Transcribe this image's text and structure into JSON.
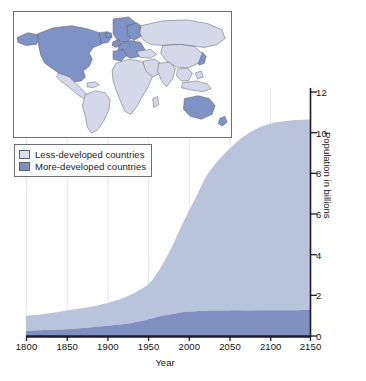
{
  "figure": {
    "kind": "area-chart-with-map-inset",
    "background": "#ffffff"
  },
  "colors": {
    "less_developed": "#b9c4dc",
    "more_developed": "#7f8fc0",
    "axis": "#1b1b2b",
    "gridline": "#e2e6ef",
    "map_land_less_developed": "#d4d8e8",
    "map_land_more_developed": "#7f92c6",
    "map_border": "#6d6d75",
    "map_ocean": "#ffffff"
  },
  "map_inset": {
    "name": "world-map-inset",
    "more_developed_regions": [
      "United States",
      "Canada",
      "Greenland",
      "Europe",
      "Russia",
      "Japan",
      "Australia",
      "New Zealand"
    ],
    "less_developed_regions": [
      "Latin America",
      "Africa",
      "Asia",
      "Middle East",
      "Oceania"
    ]
  },
  "legend": {
    "items": [
      {
        "label": "Less-developed countries",
        "color": "#d9dff0",
        "key": "less_developed"
      },
      {
        "label": "More-developed countries",
        "color": "#7f8fc0",
        "key": "more_developed"
      }
    ]
  },
  "chart_data": {
    "type": "area",
    "stacked": true,
    "title": "",
    "xlabel": "Year",
    "ylabel": "Population in billions",
    "xlim": [
      1800,
      2150
    ],
    "ylim": [
      0,
      12
    ],
    "xticks": [
      1800,
      1850,
      1900,
      1950,
      2000,
      2050,
      2100,
      2150
    ],
    "yticks": [
      0,
      2,
      4,
      6,
      8,
      10,
      12
    ],
    "xtick_labels": [
      "1800",
      "1850",
      "1900",
      "1950",
      "2000",
      "2050",
      "2100",
      "2150"
    ],
    "ytick_labels": [
      "0",
      "2",
      "4",
      "6",
      "8",
      "10",
      "12"
    ],
    "grid": "vertical-only",
    "y_axis_position": "right",
    "legend_position": "upper-left",
    "x": [
      1800,
      1825,
      1850,
      1875,
      1900,
      1925,
      1950,
      1960,
      1970,
      1980,
      1990,
      2000,
      2010,
      2025,
      2050,
      2075,
      2100,
      2125,
      2150
    ],
    "series": [
      {
        "name": "More-developed countries",
        "color": "#7f8fc0",
        "values": [
          0.25,
          0.29,
          0.33,
          0.4,
          0.5,
          0.61,
          0.81,
          0.92,
          1.01,
          1.08,
          1.15,
          1.19,
          1.22,
          1.25,
          1.26,
          1.26,
          1.27,
          1.27,
          1.28
        ]
      },
      {
        "name": "Less-developed countries",
        "color": "#b9c4dc",
        "values": [
          0.73,
          0.8,
          0.92,
          1.0,
          1.12,
          1.34,
          1.72,
          2.1,
          2.66,
          3.35,
          4.15,
          4.93,
          5.68,
          6.8,
          7.94,
          8.75,
          9.17,
          9.33,
          9.37
        ]
      }
    ],
    "totals": [
      0.98,
      1.09,
      1.25,
      1.4,
      1.62,
      1.95,
      2.53,
      3.02,
      3.67,
      4.43,
      5.3,
      6.12,
      6.9,
      8.05,
      9.2,
      10.01,
      10.44,
      10.6,
      10.65
    ],
    "annotations": []
  }
}
